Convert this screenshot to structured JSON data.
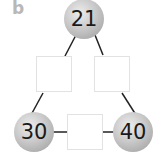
{
  "label": "b",
  "nodes": {
    "top": "21",
    "bottom_left": "30",
    "bottom_right": "40"
  },
  "boxes": {
    "left": "",
    "right": "",
    "bottom": ""
  },
  "colors": {
    "circle_fill": "#c9c9c9",
    "line": "#222222",
    "box_border": "#e2e2e2",
    "label": "#b8b8b8"
  }
}
